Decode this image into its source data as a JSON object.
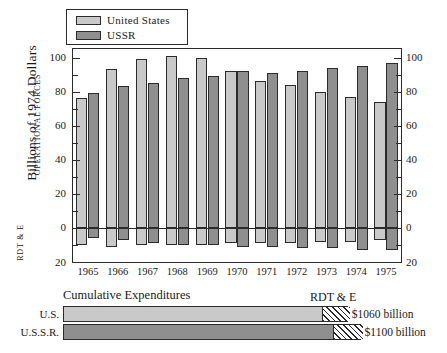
{
  "legend": {
    "items": [
      {
        "label": "United States",
        "color": "#c9c9c9",
        "swatch_name": "legend-swatch-united-states"
      },
      {
        "label": "USSR",
        "color": "#8f8f8f",
        "swatch_name": "legend-swatch-ussr"
      }
    ]
  },
  "axis": {
    "y_title": "Billions of 1974 Dollars",
    "section_upper": "OPERATIONAL FORCES",
    "section_lower": "RDT & E",
    "y_ticks_left": [
      "100",
      "80",
      "60",
      "40",
      "20",
      "0",
      "20"
    ],
    "y_ticks_right": [
      "100",
      "80",
      "60",
      "40",
      "20",
      "0",
      "20"
    ]
  },
  "cumulative": {
    "title": "Cumulative Expenditures",
    "rdte_caption": "RDT & E",
    "rows": [
      {
        "label": "U.S.",
        "value": "$1060 billion",
        "operational_pct": 80.5,
        "rdte_pct": 8.5,
        "color": "#c9c9c9"
      },
      {
        "label": "U.S.S.R.",
        "value": "$1100 billion",
        "operational_pct": 84.0,
        "rdte_pct": 9.0,
        "color": "#8f8f8f"
      }
    ]
  },
  "chart_data": {
    "type": "bar",
    "xlabel": "",
    "ylabel": "Billions of 1974 Dollars",
    "ylim": [
      -20,
      105
    ],
    "grid": false,
    "legend_position": "top-left",
    "categories": [
      "1965",
      "1966",
      "1967",
      "1968",
      "1969",
      "1970",
      "1971",
      "1972",
      "1973",
      "1974",
      "1975"
    ],
    "series": [
      {
        "name": "United States",
        "segment": "OPERATIONAL FORCES",
        "color": "#c9c9c9",
        "values": [
          76,
          93,
          99,
          101,
          100,
          92,
          86,
          84,
          80,
          77,
          74
        ]
      },
      {
        "name": "USSR",
        "segment": "OPERATIONAL FORCES",
        "color": "#8f8f8f",
        "values": [
          79,
          83,
          85,
          88,
          89,
          92,
          91,
          92,
          94,
          95,
          97
        ]
      },
      {
        "name": "United States",
        "segment": "RDT & E",
        "color": "#c9c9c9",
        "values": [
          -10,
          -11,
          -10,
          -10,
          -10,
          -9,
          -9,
          -9,
          -8,
          -8,
          -7
        ]
      },
      {
        "name": "USSR",
        "segment": "RDT & E",
        "color": "#8f8f8f",
        "values": [
          -6,
          -7,
          -9,
          -10,
          -10,
          -11,
          -11,
          -12,
          -12,
          -13,
          -13
        ]
      }
    ]
  }
}
